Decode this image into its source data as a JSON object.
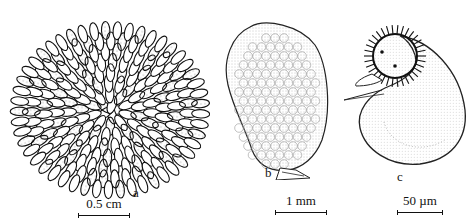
{
  "figure": {
    "panels": [
      {
        "id": "a",
        "label": "a",
        "subject": "colony-of-elongated-cells",
        "scale_bar": "0.5 cm"
      },
      {
        "id": "b",
        "label": "b",
        "subject": "sac-shaped-colony-with-stalk",
        "scale_bar": "1 mm"
      },
      {
        "id": "c",
        "label": "c",
        "subject": "bean-shaped-cell-with-ciliated-head",
        "scale_bar": "50 µm"
      }
    ]
  }
}
